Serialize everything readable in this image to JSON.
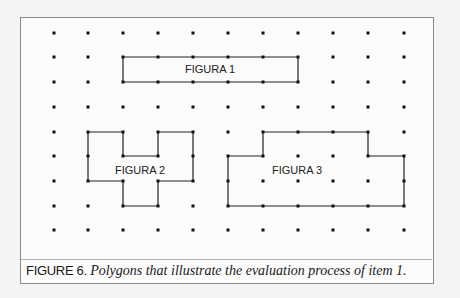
{
  "figure": {
    "grid": {
      "columns_x": [
        54,
        88,
        123,
        158,
        193,
        228,
        263,
        298,
        333,
        368,
        404
      ],
      "rows_y": [
        33,
        57,
        82,
        107,
        132,
        156,
        181,
        206,
        230
      ],
      "dot_color": "#111111"
    },
    "polygons": [
      {
        "label": "FIGURA 1",
        "vertices_grid": [
          [
            2,
            1
          ],
          [
            7,
            1
          ],
          [
            7,
            2
          ],
          [
            2,
            2
          ]
        ],
        "label_pos": [
          210,
          73
        ]
      },
      {
        "label": "FIGURA 2",
        "vertices_grid": [
          [
            1,
            4
          ],
          [
            2,
            4
          ],
          [
            2,
            5
          ],
          [
            3,
            5
          ],
          [
            3,
            4
          ],
          [
            4,
            4
          ],
          [
            4,
            6
          ],
          [
            3,
            6
          ],
          [
            3,
            7
          ],
          [
            2,
            7
          ],
          [
            2,
            6
          ],
          [
            1,
            6
          ]
        ],
        "label_pos": [
          140,
          174
        ]
      },
      {
        "label": "FIGURA 3",
        "vertices_grid": [
          [
            6,
            4
          ],
          [
            9,
            4
          ],
          [
            9,
            5
          ],
          [
            10,
            5
          ],
          [
            10,
            7
          ],
          [
            5,
            7
          ],
          [
            5,
            5
          ],
          [
            6,
            5
          ]
        ],
        "label_pos": [
          297,
          174
        ]
      }
    ],
    "line_color": "#222222"
  },
  "caption": {
    "label": "FIGURE 6.",
    "text": "Polygons that illustrate the evaluation process of item 1."
  }
}
